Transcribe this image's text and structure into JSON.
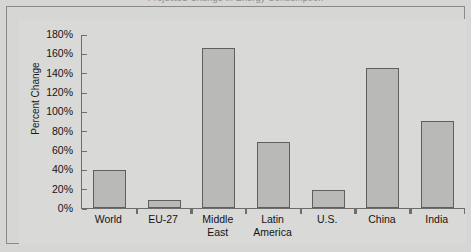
{
  "figure": {
    "cropped_title_fragment": "Projected Change in Energy Consumption",
    "background_color": "#d6d6d4",
    "panel_color": "#d9d9d7",
    "frame_color": "#8a8a88",
    "axis_color": "#6d6d6b",
    "bar_fill_color": "#b9b9b7",
    "bar_border_color": "#5f5f5d"
  },
  "chart_data": {
    "type": "bar",
    "title": "",
    "xlabel": "",
    "ylabel": "Percent Change",
    "categories": [
      "World",
      "EU-27",
      "Middle East",
      "Latin America",
      "U.S.",
      "China",
      "India"
    ],
    "values": [
      39,
      8,
      166,
      68,
      19,
      145,
      90
    ],
    "ylim": [
      0,
      180
    ],
    "ytick_step": 20,
    "ytick_labels": [
      "0%",
      "20%",
      "40%",
      "60%",
      "80%",
      "100%",
      "120%",
      "140%",
      "160%",
      "180%"
    ],
    "ytick_values": [
      0,
      20,
      40,
      60,
      80,
      100,
      120,
      140,
      160,
      180
    ],
    "grid": false,
    "legend": false,
    "value_unit": "percent"
  }
}
